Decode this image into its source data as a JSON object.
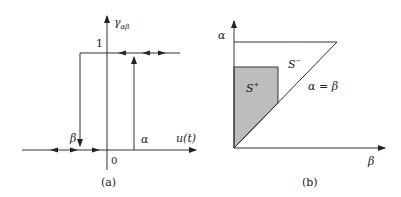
{
  "panel_a": {
    "y_axis_label": "γ",
    "y_axis_sub": "αβ",
    "level_one": "1",
    "beta_label": "β",
    "alpha_label": "α",
    "x_axis_label": "u(t)",
    "origin_label": "0",
    "caption": "(a)"
  },
  "panel_b": {
    "y_axis_label": "α",
    "x_axis_label": "β",
    "region_minus": "S",
    "region_minus_sup": "−",
    "region_plus": "S",
    "region_plus_sup": "+",
    "diagonal_label": "α = β",
    "caption": "(b)"
  },
  "colors": {
    "line": "#333333",
    "shade": "#bdbdbd"
  }
}
